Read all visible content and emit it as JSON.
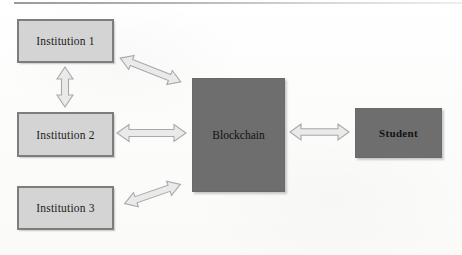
{
  "diagram": {
    "colors": {
      "node_light_fill": "#d4d4d4",
      "node_light_border": "#7d7d7d",
      "node_dark_fill": "#6e6e6e",
      "arrow_fill": "#eaeaea",
      "arrow_stroke": "#a9a9a9",
      "background": "#fdfdfc",
      "text": "#1b1b1b"
    },
    "nodes": [
      {
        "id": "institution-1",
        "label": "Institution 1",
        "style": "light",
        "x": 17,
        "y": 19,
        "w": 97,
        "h": 44
      },
      {
        "id": "institution-2",
        "label": "Institution 2",
        "style": "light",
        "x": 17,
        "y": 112,
        "w": 97,
        "h": 45
      },
      {
        "id": "institution-3",
        "label": "Institution 3",
        "style": "light",
        "x": 17,
        "y": 186,
        "w": 97,
        "h": 44
      },
      {
        "id": "blockchain",
        "label": "Blockchain",
        "style": "dark",
        "x": 192,
        "y": 78,
        "w": 93,
        "h": 114
      },
      {
        "id": "student",
        "label": "Student",
        "style": "dark-bold",
        "x": 355,
        "y": 108,
        "w": 87,
        "h": 50
      }
    ],
    "connectors": [
      {
        "id": "institution1-institution2",
        "from": "institution-1",
        "to": "institution-2",
        "direction": "bidirectional",
        "orientation": "vertical"
      },
      {
        "id": "institution1-blockchain",
        "from": "institution-1",
        "to": "blockchain",
        "direction": "bidirectional",
        "orientation": "diagonal-down"
      },
      {
        "id": "institution2-blockchain",
        "from": "institution-2",
        "to": "blockchain",
        "direction": "bidirectional",
        "orientation": "horizontal"
      },
      {
        "id": "institution3-blockchain",
        "from": "institution-3",
        "to": "blockchain",
        "direction": "bidirectional",
        "orientation": "diagonal-up"
      },
      {
        "id": "blockchain-student",
        "from": "blockchain",
        "to": "student",
        "direction": "bidirectional",
        "orientation": "horizontal"
      }
    ]
  }
}
